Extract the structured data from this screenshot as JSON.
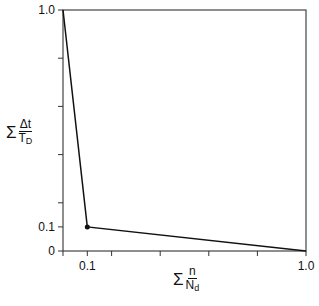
{
  "chart_data": {
    "type": "line",
    "title": "",
    "xlabel": "Σ n/N_d",
    "ylabel": "Σ Δt/T_D",
    "xlim": [
      0,
      1.0
    ],
    "ylim": [
      0,
      1.0
    ],
    "grid": false,
    "legend": null,
    "x_ticks": [
      0,
      0.1,
      0.2,
      0.4,
      0.6,
      0.8,
      1.0
    ],
    "x_tick_labels": [
      "",
      "0.1",
      "",
      "",
      "",
      "",
      "1.0"
    ],
    "y_ticks": [
      0,
      0.1,
      0.2,
      0.4,
      0.6,
      0.8,
      1.0
    ],
    "y_tick_labels": [
      "0",
      "0.1",
      "",
      "",
      "",
      "",
      "1.0"
    ],
    "series": [
      {
        "name": "interaction envelope",
        "x": [
          0.0,
          0.1,
          1.0
        ],
        "y": [
          1.0,
          0.1,
          0.0
        ],
        "markers": [
          {
            "x": 0.1,
            "y": 0.1
          }
        ]
      }
    ],
    "color": "#111111"
  },
  "labels": {
    "y_axis": {
      "sigma": "Σ",
      "numerator": "Δt",
      "denominator": "T",
      "denominator_sub": "D"
    },
    "x_axis": {
      "sigma": "Σ",
      "numerator": "n",
      "denominator": "N",
      "denominator_sub": "d"
    }
  }
}
